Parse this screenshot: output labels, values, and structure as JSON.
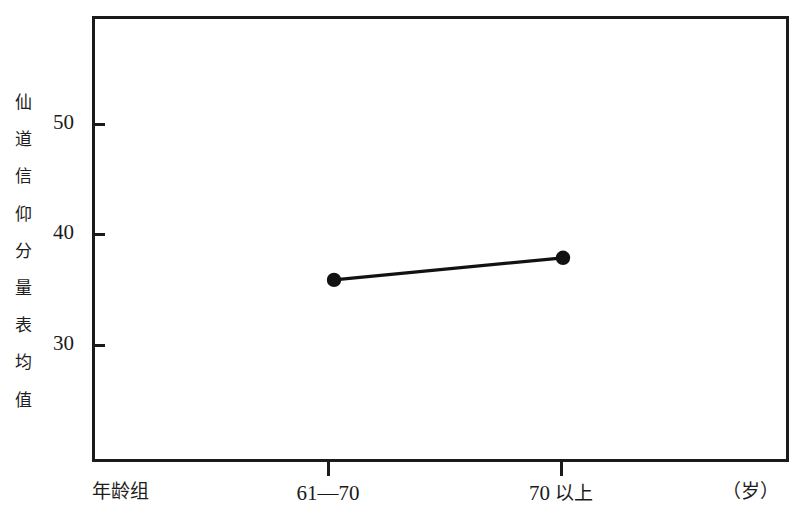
{
  "chart_data": {
    "type": "line",
    "title": "",
    "subtitle": "",
    "xlabel": "年龄组",
    "xunit": "（岁）",
    "ylabel": "仙道信仰分量表均值",
    "categories": [
      "61—70",
      "70以上"
    ],
    "series": [
      {
        "name": "仙道信仰分量表均值",
        "values": [
          35.8,
          37.8
        ],
        "marker": "filled-circle",
        "color": "#121212"
      }
    ],
    "ytick_labels": [
      "50",
      "40",
      "30"
    ],
    "ytick_values": [
      50,
      40,
      30
    ],
    "ylim": [
      24.4,
      64.7
    ],
    "xlim": [
      0,
      3
    ],
    "grid": false,
    "legend": false,
    "legend_position": "none"
  },
  "axes": {
    "y_title_chars": "仙\n道\n信\n仰\n分\n量\n表\n均\n值",
    "y_ticks": [
      {
        "label": "50",
        "value": 50
      },
      {
        "label": "40",
        "value": 40
      },
      {
        "label": "30",
        "value": 30
      }
    ],
    "x_ticks": [
      {
        "label_num": "61—70",
        "label_cjk": "",
        "value": 1
      },
      {
        "label_num": "70",
        "label_cjk": "以上",
        "value": 2
      }
    ],
    "x_title": "年龄组",
    "x_unit": "（岁）"
  },
  "colors": {
    "frame": "#1b1b1b",
    "series": "#121212",
    "background": "#ffffff",
    "text": "#1a1a1a"
  }
}
